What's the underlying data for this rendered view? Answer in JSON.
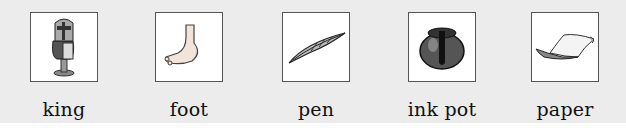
{
  "cards": [
    {
      "label": "king",
      "icon": "king-icon"
    },
    {
      "label": "foot",
      "icon": "foot-icon"
    },
    {
      "label": "pen",
      "icon": "quill-pen-icon"
    },
    {
      "label": "ink pot",
      "icon": "ink-pot-icon"
    },
    {
      "label": "paper",
      "icon": "paper-scroll-icon"
    }
  ]
}
